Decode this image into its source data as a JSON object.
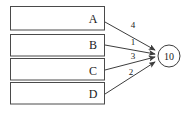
{
  "diagram": {
    "type": "flow-convergence-diagram",
    "background_color": "#ffffff",
    "line_color": "#3d3d3d",
    "text_color": "#1a1a1a",
    "sources": [
      {
        "label": "A",
        "weight": "4"
      },
      {
        "label": "B",
        "weight": "1"
      },
      {
        "label": "C",
        "weight": "3"
      },
      {
        "label": "D",
        "weight": "2"
      }
    ],
    "sink": {
      "label": "10",
      "shape": "circle"
    }
  }
}
